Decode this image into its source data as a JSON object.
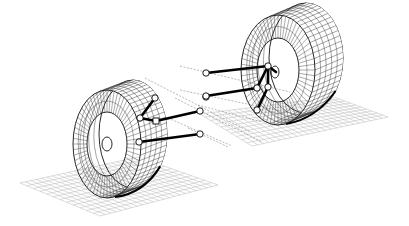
{
  "diagram": {
    "colors": {
      "background": "#ffffff",
      "link": "#000000",
      "grid": "#b8b8b8",
      "wire": "#333333"
    },
    "grids": [
      {
        "id": "left-ground-grid",
        "corners": [
          [
            20,
            183
          ],
          [
            138,
            157
          ],
          [
            218,
            185
          ],
          [
            100,
            216
          ]
        ],
        "rows": 12,
        "cols": 22
      },
      {
        "id": "right-ground-grid",
        "corners": [
          [
            200,
            114
          ],
          [
            334,
            97
          ],
          [
            388,
            117
          ],
          [
            252,
            146
          ]
        ],
        "rows": 10,
        "cols": 24
      }
    ],
    "wheels": [
      {
        "id": "left-wheel",
        "face": {
          "cx": 107,
          "cy": 144,
          "rx": 34,
          "ry": 54
        },
        "depth": [
          26,
          -10
        ],
        "hub": {
          "cx": 107,
          "cy": 144,
          "rx": 5,
          "ry": 7
        },
        "rim": {
          "rx": 20,
          "ry": 32
        },
        "spokes": 60
      },
      {
        "id": "right-wheel",
        "face": {
          "cx": 278,
          "cy": 70,
          "rx": 37,
          "ry": 55
        },
        "depth": [
          28,
          -12
        ],
        "hub": {
          "cx": 275,
          "cy": 72,
          "rx": 4,
          "ry": 6
        },
        "rim": {
          "rx": 21,
          "ry": 32
        },
        "spokes": 60
      }
    ],
    "axis_lines": [
      {
        "from": [
          145,
          78
        ],
        "to": [
          250,
          132
        ]
      },
      {
        "from": [
          175,
          98
        ],
        "to": [
          262,
          142
        ]
      },
      {
        "from": [
          168,
          118
        ],
        "to": [
          232,
          146
        ]
      },
      {
        "from": [
          188,
          128
        ],
        "to": [
          228,
          147
        ]
      },
      {
        "from": [
          180,
          66
        ],
        "to": [
          290,
          92
        ]
      },
      {
        "from": [
          180,
          90
        ],
        "to": [
          300,
          115
        ]
      },
      {
        "from": [
          198,
          105
        ],
        "to": [
          262,
          122
        ]
      }
    ],
    "links": [
      {
        "from": [
          140,
          118
        ],
        "to": [
          155,
          98
        ]
      },
      {
        "from": [
          140,
          118
        ],
        "to": [
          156,
          121
        ]
      },
      {
        "from": [
          156,
          121
        ],
        "to": [
          200,
          111
        ]
      },
      {
        "from": [
          139,
          142
        ],
        "to": [
          200,
          134
        ]
      },
      {
        "from": [
          206,
          73
        ],
        "to": [
          268,
          66
        ]
      },
      {
        "from": [
          206,
          96
        ],
        "to": [
          257,
          88
        ]
      },
      {
        "from": [
          257,
          88
        ],
        "to": [
          268,
          66
        ]
      },
      {
        "from": [
          268,
          87
        ],
        "to": [
          268,
          66
        ]
      },
      {
        "from": [
          257,
          110
        ],
        "to": [
          268,
          87
        ]
      },
      {
        "from": [
          268,
          66
        ],
        "to": [
          276,
          72
        ]
      }
    ],
    "joints": [
      {
        "name": "left-upper-knuckle",
        "cx": 155,
        "cy": 98
      },
      {
        "name": "left-upright-top",
        "cx": 140,
        "cy": 118
      },
      {
        "name": "left-upright-bottom",
        "cx": 139,
        "cy": 142
      },
      {
        "name": "left-upper-inboard",
        "cx": 200,
        "cy": 111
      },
      {
        "name": "left-lower-inboard",
        "cx": 200,
        "cy": 134
      },
      {
        "name": "left-steer-inboard",
        "cx": 206,
        "cy": 97
      },
      {
        "name": "right-upper-inboard",
        "cx": 206,
        "cy": 73
      },
      {
        "name": "right-lower-inboard",
        "cx": 206,
        "cy": 96
      },
      {
        "name": "right-upright-top",
        "cx": 268,
        "cy": 66
      },
      {
        "name": "right-upright-mid-a",
        "cx": 257,
        "cy": 88
      },
      {
        "name": "right-upright-mid-b",
        "cx": 268,
        "cy": 87
      },
      {
        "name": "right-upright-bottom",
        "cx": 257,
        "cy": 110
      }
    ]
  }
}
